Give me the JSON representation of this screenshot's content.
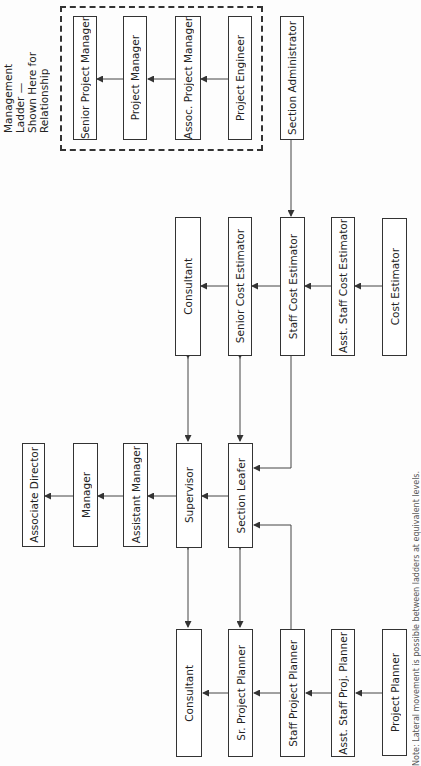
{
  "diagram": {
    "type": "career ladder org chart (rotated 90°)",
    "management_ladder_label": [
      "Management Ladder —",
      "Shown Here for",
      "Relationship"
    ],
    "management_ladder": [
      "Senior Project Manager",
      "Project Manager",
      "Assoc. Project Manager",
      "Project Engineer"
    ],
    "section_administrator": "Section Administrator",
    "cost_estimator_ladder": [
      "Consultant",
      "Senior Cost Estimator",
      "Staff Cost Estimator",
      "Asst. Staff Cost Estimator",
      "Cost Estimator"
    ],
    "supervisory_ladder": [
      "Associate Director",
      "Manager",
      "Assistant Manager",
      "Supervisor",
      "Section Leafer"
    ],
    "planner_ladder": [
      "Consultant",
      "Sr. Project Planner",
      "Staff Project Planner",
      "Asst. Staff Proj. Planner",
      "Project Planner"
    ],
    "footnote": "Note: Lateral movement is possible between ladders at equivalent levels."
  }
}
